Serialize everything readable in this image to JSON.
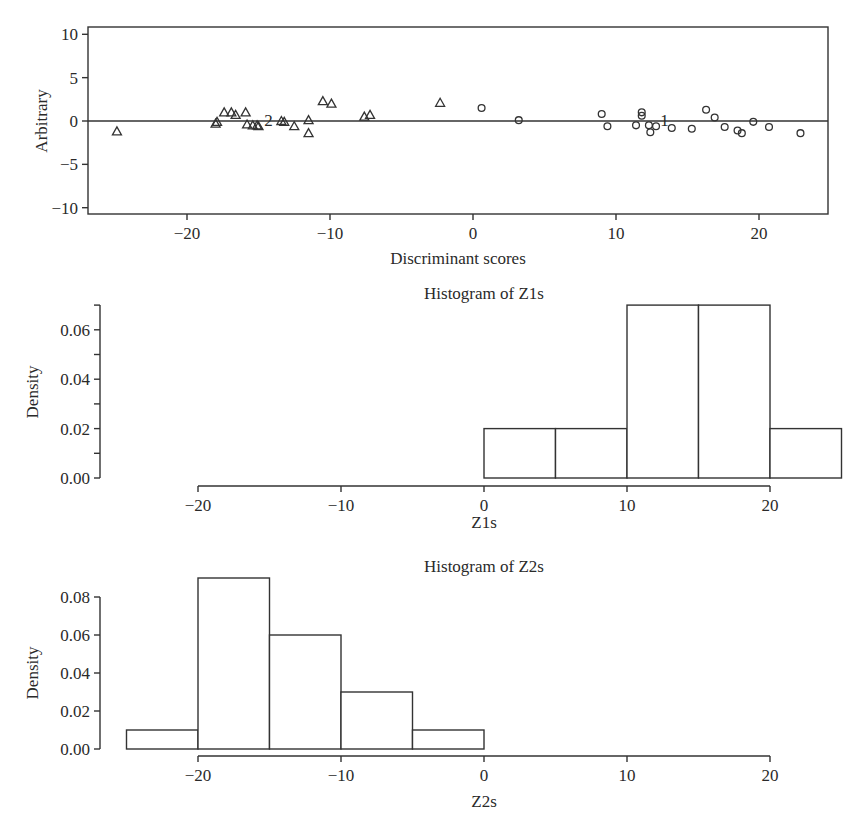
{
  "chart_data": [
    {
      "type": "scatter",
      "title": "",
      "xlabel": "Discriminant scores",
      "ylabel": "Arbitrary",
      "xlim": [
        -26.5,
        25
      ],
      "ylim": [
        -10.8,
        10.8
      ],
      "x_ticks": [
        -20,
        -10,
        0,
        10,
        20
      ],
      "y_ticks": [
        10,
        5,
        0,
        -5,
        -10
      ],
      "x_tick_labels": [
        "−20",
        "−10",
        "0",
        "10",
        "20"
      ],
      "y_tick_labels": [
        "10",
        "5",
        "0",
        "−5",
        "−10"
      ],
      "reference_line_y": 0,
      "grid": false,
      "series": [
        {
          "name": "Group 2",
          "marker": "triangle",
          "centroid_label": "2",
          "centroid": [
            -14.3,
            0.0
          ],
          "points": [
            [
              -24.9,
              -1.2
            ],
            [
              -18.0,
              -0.3
            ],
            [
              -17.9,
              -0.1
            ],
            [
              -17.4,
              1.0
            ],
            [
              -16.9,
              1.0
            ],
            [
              -16.6,
              0.7
            ],
            [
              -15.9,
              1.0
            ],
            [
              -15.8,
              -0.4
            ],
            [
              -15.4,
              -0.5
            ],
            [
              -15.1,
              -0.5
            ],
            [
              -15.0,
              -0.6
            ],
            [
              -13.4,
              0.0
            ],
            [
              -13.2,
              -0.1
            ],
            [
              -12.5,
              -0.6
            ],
            [
              -11.5,
              0.1
            ],
            [
              -11.5,
              -1.4
            ],
            [
              -10.5,
              2.3
            ],
            [
              -9.9,
              2.0
            ],
            [
              -7.6,
              0.5
            ],
            [
              -7.2,
              0.7
            ],
            [
              -2.3,
              2.1
            ]
          ]
        },
        {
          "name": "Group 1",
          "marker": "circle",
          "centroid_label": "1",
          "centroid": [
            13.4,
            0.0
          ],
          "points": [
            [
              0.6,
              1.5
            ],
            [
              3.2,
              0.1
            ],
            [
              9.0,
              0.8
            ],
            [
              9.4,
              -0.6
            ],
            [
              11.4,
              -0.5
            ],
            [
              11.8,
              1.0
            ],
            [
              11.8,
              0.6
            ],
            [
              12.3,
              -0.5
            ],
            [
              12.4,
              -1.3
            ],
            [
              12.8,
              -0.6
            ],
            [
              13.9,
              -0.8
            ],
            [
              15.3,
              -0.9
            ],
            [
              16.3,
              1.3
            ],
            [
              16.9,
              0.4
            ],
            [
              17.6,
              -0.7
            ],
            [
              18.5,
              -1.1
            ],
            [
              18.8,
              -1.4
            ],
            [
              19.6,
              -0.1
            ],
            [
              20.7,
              -0.7
            ],
            [
              22.9,
              -1.4
            ]
          ]
        }
      ]
    },
    {
      "type": "bar",
      "subtype": "histogram",
      "title": "Histogram of Z1s",
      "xlabel": "Z1s",
      "ylabel": "Density",
      "bin_edges": [
        0,
        5,
        10,
        15,
        20,
        25
      ],
      "categories": [
        "0-5",
        "5-10",
        "10-15",
        "15-20",
        "20-25"
      ],
      "values": [
        0.02,
        0.02,
        0.07,
        0.07,
        0.02
      ],
      "xlim": [
        -20,
        25
      ],
      "ylim": [
        0,
        0.07
      ],
      "x_ticks": [
        -20,
        -10,
        0,
        10,
        20
      ],
      "x_tick_labels": [
        "−20",
        "−10",
        "0",
        "10",
        "20"
      ],
      "y_ticks": [
        0.0,
        0.02,
        0.04,
        0.06
      ],
      "y_tick_labels": [
        "0.00",
        "0.02",
        "0.04",
        "0.06"
      ],
      "y_minor_ticks": [
        0.01,
        0.03,
        0.05,
        0.07
      ],
      "grid": false
    },
    {
      "type": "bar",
      "subtype": "histogram",
      "title": "Histogram of Z2s",
      "xlabel": "Z2s",
      "ylabel": "Density",
      "bin_edges": [
        -25,
        -20,
        -15,
        -10,
        -5,
        0
      ],
      "categories": [
        "-25--20",
        "-20--15",
        "-15--10",
        "-10--5",
        "-5-0"
      ],
      "values": [
        0.01,
        0.09,
        0.06,
        0.03,
        0.01
      ],
      "xlim": [
        -25,
        20
      ],
      "ylim": [
        0,
        0.09
      ],
      "x_ticks": [
        -20,
        -10,
        0,
        10,
        20
      ],
      "x_tick_labels": [
        "−20",
        "−10",
        "0",
        "10",
        "20"
      ],
      "y_ticks": [
        0.0,
        0.02,
        0.04,
        0.06,
        0.08
      ],
      "y_tick_labels": [
        "0.00",
        "0.02",
        "0.04",
        "0.06",
        "0.08"
      ],
      "grid": false
    }
  ]
}
